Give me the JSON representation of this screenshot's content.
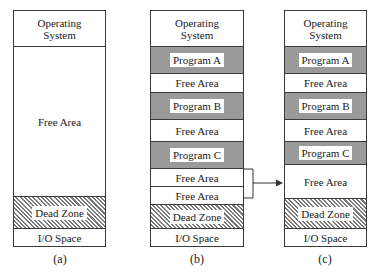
{
  "diagrams": [
    {
      "caption": "(a)",
      "segments": [
        {
          "type": "os",
          "label_line1": "Operating",
          "label_line2": "System"
        },
        {
          "type": "free",
          "label": "Free Area"
        },
        {
          "type": "dead",
          "label": "Dead Zone"
        },
        {
          "type": "io",
          "label": "I/O Space"
        }
      ]
    },
    {
      "caption": "(b)",
      "segments": [
        {
          "type": "os",
          "label_line1": "Operating",
          "label_line2": "System"
        },
        {
          "type": "program",
          "label": "Program A"
        },
        {
          "type": "free",
          "label": "Free Area"
        },
        {
          "type": "program",
          "label": "Program B"
        },
        {
          "type": "free",
          "label": "Free Area"
        },
        {
          "type": "program",
          "label": "Program C"
        },
        {
          "type": "free",
          "label": "Free Area"
        },
        {
          "type": "free",
          "label": "Free Area"
        },
        {
          "type": "dead",
          "label": "Dead Zone"
        },
        {
          "type": "io",
          "label": "I/O Space"
        }
      ]
    },
    {
      "caption": "(c)",
      "segments": [
        {
          "type": "os",
          "label_line1": "Operating",
          "label_line2": "System"
        },
        {
          "type": "program",
          "label": "Program A"
        },
        {
          "type": "free",
          "label": "Free Area"
        },
        {
          "type": "program",
          "label": "Program B"
        },
        {
          "type": "free",
          "label": "Free Area"
        },
        {
          "type": "program",
          "label": "Program C"
        },
        {
          "type": "free",
          "label": "Free Area"
        },
        {
          "type": "dead",
          "label": "Dead Zone"
        },
        {
          "type": "io",
          "label": "I/O Space"
        }
      ]
    }
  ],
  "colors": {
    "program_fill": "#9a9a9a",
    "free_fill": "#ffffff",
    "border": "#3a3a3a"
  }
}
